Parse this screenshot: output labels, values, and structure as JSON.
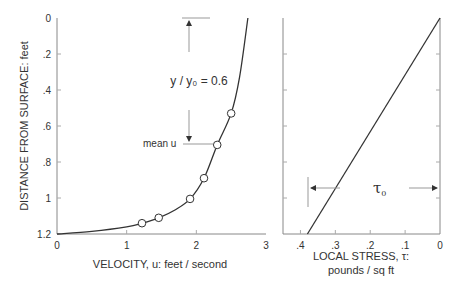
{
  "chart_data": [
    {
      "type": "line",
      "name": "velocity-profile",
      "xlabel": "VELOCITY, u:  feet / second",
      "ylabel": "DISTANCE FROM SURFACE:  feet",
      "xlim": [
        0,
        3
      ],
      "ylim": [
        0,
        1.2
      ],
      "y_inverted": true,
      "x_ticks": [
        0,
        1,
        2,
        3
      ],
      "x_tick_labels": [
        "0",
        "1",
        "2",
        "3"
      ],
      "y_ticks": [
        0,
        0.2,
        0.4,
        0.6,
        0.8,
        1.0,
        1.2
      ],
      "y_tick_labels": [
        "0",
        ".2",
        ".4",
        ".6",
        ".8",
        "1",
        "1.2"
      ],
      "grid": false,
      "curve": {
        "x": [
          0.0,
          0.5,
          1.0,
          1.22,
          1.46,
          1.7,
          1.91,
          2.11,
          2.3,
          2.5,
          2.62,
          2.74
        ],
        "y": [
          1.2,
          1.185,
          1.16,
          1.14,
          1.11,
          1.065,
          1.005,
          0.89,
          0.705,
          0.53,
          0.33,
          0.0
        ]
      },
      "points": {
        "x": [
          1.22,
          1.46,
          1.91,
          2.11,
          2.3,
          2.5
        ],
        "y": [
          1.14,
          1.11,
          1.005,
          0.89,
          0.705,
          0.53
        ]
      },
      "annotations": {
        "depth_ratio": "y / y₀ = 0.6",
        "mean_label": "mean u",
        "mean_depth": 0.705,
        "arrow_top_depth": 0.0,
        "arrow_x": 1.9
      }
    },
    {
      "type": "line",
      "name": "stress-profile",
      "xlabel": "LOCAL STRESS, τ:",
      "xlabel2": "pounds / sq ft",
      "xlim": [
        0.45,
        0
      ],
      "ylim": [
        0,
        1.2
      ],
      "y_inverted": true,
      "x_ticks": [
        0.4,
        0.3,
        0.2,
        0.1,
        0
      ],
      "x_tick_labels": [
        ".4",
        ".3",
        ".2",
        ".1",
        "0"
      ],
      "grid": false,
      "line": {
        "x": [
          0,
          0.38
        ],
        "y": [
          0,
          1.2
        ]
      },
      "annotations": {
        "tau0_label": "τ",
        "tau0_sub": "0",
        "tau0_value": 0.38,
        "tau0_depth": 0.95
      }
    }
  ]
}
